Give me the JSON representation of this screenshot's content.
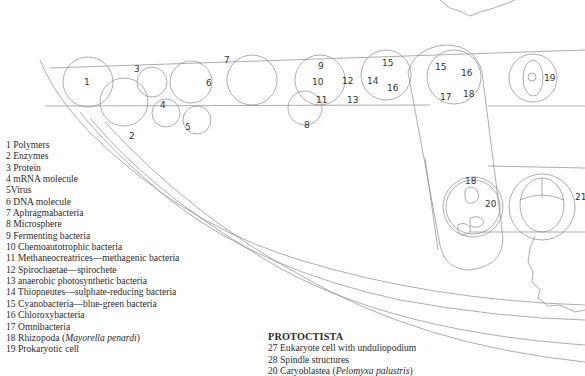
{
  "diagram": {
    "labels": [
      "1",
      "2",
      "3",
      "4",
      "5",
      "6",
      "7",
      "8",
      "9",
      "10",
      "11",
      "12",
      "13",
      "14",
      "15",
      "16",
      "15",
      "16",
      "17",
      "18",
      "19",
      "18",
      "20",
      "21"
    ]
  },
  "legend": {
    "items": [
      {
        "num": "1",
        "text": "Polymers"
      },
      {
        "num": "2",
        "text": "Enzymes"
      },
      {
        "num": "3",
        "text": "Protein"
      },
      {
        "num": "4",
        "text": "mRNA molecule"
      },
      {
        "num": "5",
        "text": "Virus"
      },
      {
        "num": "6",
        "text": "DNA molecule"
      },
      {
        "num": "7",
        "text": "Aphragmabacteria"
      },
      {
        "num": "8",
        "text": "Microsphere"
      },
      {
        "num": "9",
        "text": "Fermenting bacteria"
      },
      {
        "num": "10",
        "text": "Chemoautotrophic bacteria"
      },
      {
        "num": "11",
        "text": "Methaneocreatrices—methagenic bacteria"
      },
      {
        "num": "12",
        "text": "Spirochaetae—spirochete"
      },
      {
        "num": "13",
        "text": "anaerobic photosynthetic bacteria"
      },
      {
        "num": "14",
        "text": "Thiopneutes—sulphate-reducing bacteria"
      },
      {
        "num": "15",
        "text": "Cyanobacteria—blue-green bacteria"
      },
      {
        "num": "16",
        "text": "Chloroxybacteria"
      },
      {
        "num": "17",
        "text": "Omnibacteria"
      },
      {
        "num": "18",
        "text": "Rhizopoda (",
        "italic": "Mayorella penardi",
        "after": ")"
      },
      {
        "num": "19",
        "text": "Prokaryotic cell"
      }
    ]
  },
  "protoctista": {
    "heading": "PROTOCTISTA",
    "items": [
      {
        "num": "27",
        "text": "Eukaryote cell with unduliopodium"
      },
      {
        "num": "28",
        "text": "Spindle structures"
      },
      {
        "num": "20",
        "text": "Caryoblastea (",
        "italic": "Pelomyxa palustris",
        "after": ")"
      }
    ]
  }
}
